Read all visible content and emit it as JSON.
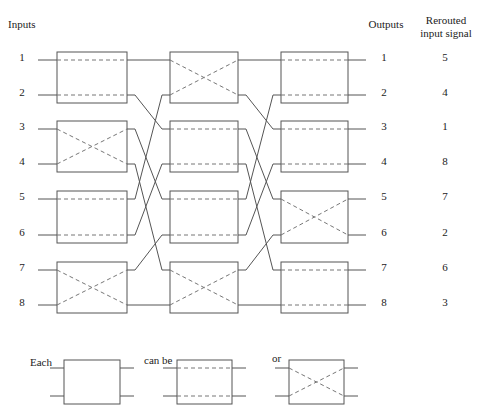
{
  "headers": {
    "inputs": "Inputs",
    "outputs": "Outputs",
    "rerouted_line1": "Rerouted",
    "rerouted_line2": "input signal"
  },
  "inputs": [
    "1",
    "2",
    "3",
    "4",
    "5",
    "6",
    "7",
    "8"
  ],
  "outputs": [
    "1",
    "2",
    "3",
    "4",
    "5",
    "6",
    "7",
    "8"
  ],
  "rerouted": [
    "5",
    "4",
    "1",
    "8",
    "7",
    "2",
    "6",
    "3"
  ],
  "stages": [
    {
      "name": "stage-1",
      "switches": [
        "straight",
        "cross",
        "straight",
        "cross"
      ]
    },
    {
      "name": "stage-2",
      "switches": [
        "cross",
        "straight",
        "straight",
        "cross"
      ]
    },
    {
      "name": "stage-3",
      "switches": [
        "straight",
        "straight",
        "cross",
        "straight"
      ]
    }
  ],
  "interconnect": "perfect-shuffle",
  "legend": {
    "each": "Each",
    "can_be": "can be",
    "or": "or",
    "states": [
      "straight",
      "cross"
    ]
  },
  "colors": {
    "line": "#555555",
    "dash": "#777777"
  }
}
